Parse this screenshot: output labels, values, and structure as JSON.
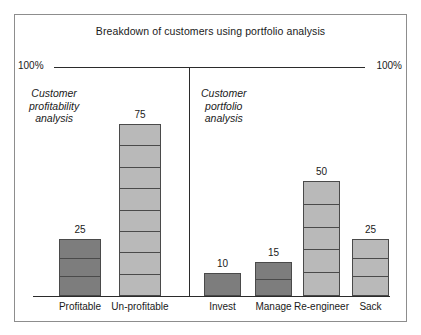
{
  "chart_data": {
    "type": "bar",
    "title": "Breakdown of customers using portfolio analysis",
    "xlabel": "",
    "ylabel": "",
    "ylim": [
      0,
      100
    ],
    "grid": false,
    "legend": "none",
    "axis_labels": {
      "left_100": "100%",
      "right_100": "100%"
    },
    "panels": [
      {
        "caption": "Customer\nprofitability\nanalysis",
        "caption_lines": [
          "Customer",
          "profitability",
          "analysis"
        ],
        "categories": [
          "Profitable",
          "Un-profitable"
        ],
        "values": [
          25,
          75
        ],
        "shades": [
          "dark",
          "light"
        ],
        "segments": [
          3,
          8
        ]
      },
      {
        "caption": "Customer\nportfolio\nanalysis",
        "caption_lines": [
          "Customer",
          "portfolio",
          "analysis"
        ],
        "categories": [
          "Invest",
          "Manage",
          "Re-engineer",
          "Sack"
        ],
        "values": [
          10,
          15,
          50,
          25
        ],
        "shades": [
          "dark",
          "dark",
          "light",
          "light"
        ],
        "segments": [
          1,
          2,
          5,
          3
        ]
      }
    ],
    "categories": [
      "Profitable",
      "Un-profitable",
      "Invest",
      "Manage",
      "Re-engineer",
      "Sack"
    ],
    "values": [
      25,
      75,
      10,
      15,
      50,
      25
    ]
  },
  "bars": [
    {
      "label": "Profitable",
      "value": 25,
      "value_text": "25",
      "shade": "dark",
      "segments": 3,
      "left": 44,
      "width": 42
    },
    {
      "label": "Un-profitable",
      "value": 75,
      "value_text": "75",
      "shade": "light",
      "segments": 8,
      "left": 104,
      "width": 42
    },
    {
      "label": "Invest",
      "value": 10,
      "value_text": "10",
      "shade": "dark",
      "segments": 1,
      "left": 189,
      "width": 37
    },
    {
      "label": "Manage",
      "value": 15,
      "value_text": "15",
      "shade": "dark",
      "segments": 2,
      "left": 240,
      "width": 37
    },
    {
      "label": "Re-engineer",
      "value": 50,
      "value_text": "50",
      "shade": "light",
      "segments": 5,
      "left": 288,
      "width": 37
    },
    {
      "label": "Sack",
      "value": 25,
      "value_text": "25",
      "shade": "light",
      "segments": 3,
      "left": 337,
      "width": 37
    }
  ],
  "colors": {
    "dark_bar": "#7d7d7d",
    "light_bar": "#b9b9b9",
    "outline": "#4a4a4a",
    "axis": "#2b2b2b",
    "frame": "#8d8d8d",
    "background": "#ffffff"
  }
}
